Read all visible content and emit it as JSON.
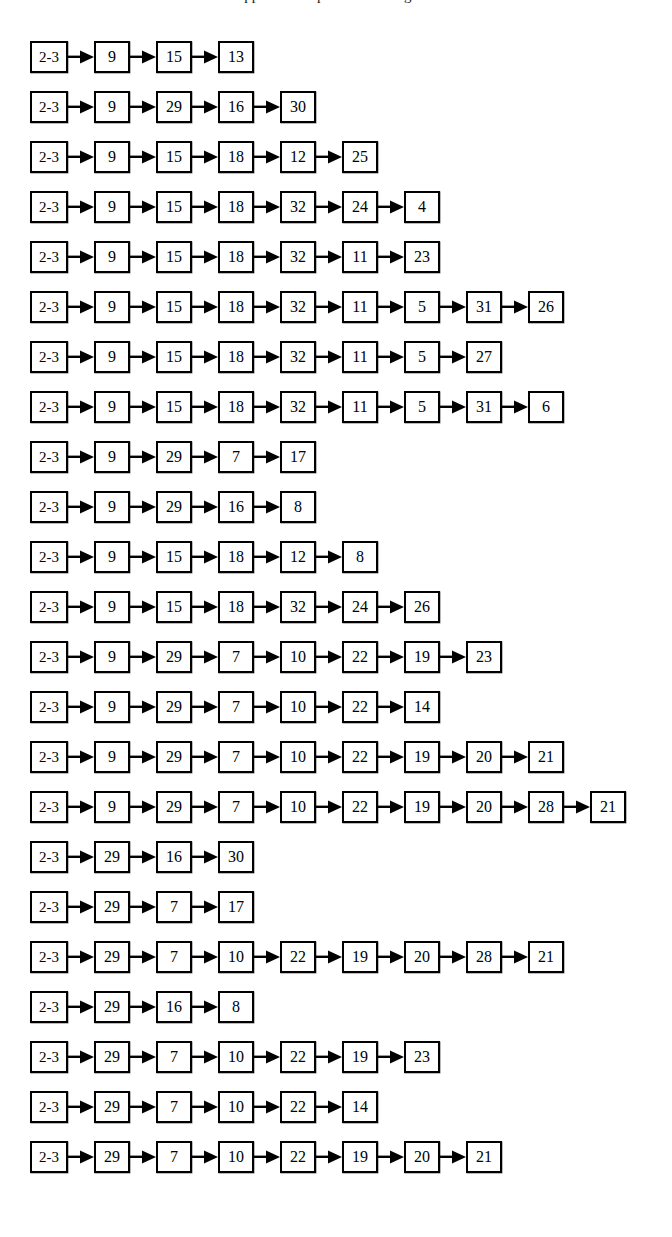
{
  "document": {
    "type": "flow-chain-diagram",
    "caption_partial": "appear to be produced using the",
    "background_color": "#ffffff",
    "line_color": "#000000",
    "text_color": "#000000",
    "root_label": "2-3",
    "arrow_glyph": "right-arrow",
    "row_count": 23
  },
  "chains": [
    {
      "nodes": [
        "2-3",
        "9",
        "15",
        "13"
      ]
    },
    {
      "nodes": [
        "2-3",
        "9",
        "29",
        "16",
        "30"
      ]
    },
    {
      "nodes": [
        "2-3",
        "9",
        "15",
        "18",
        "12",
        "25"
      ]
    },
    {
      "nodes": [
        "2-3",
        "9",
        "15",
        "18",
        "32",
        "24",
        "4"
      ]
    },
    {
      "nodes": [
        "2-3",
        "9",
        "15",
        "18",
        "32",
        "11",
        "23"
      ]
    },
    {
      "nodes": [
        "2-3",
        "9",
        "15",
        "18",
        "32",
        "11",
        "5",
        "31",
        "26"
      ]
    },
    {
      "nodes": [
        "2-3",
        "9",
        "15",
        "18",
        "32",
        "11",
        "5",
        "27"
      ]
    },
    {
      "nodes": [
        "2-3",
        "9",
        "15",
        "18",
        "32",
        "11",
        "5",
        "31",
        "6"
      ]
    },
    {
      "nodes": [
        "2-3",
        "9",
        "29",
        "7",
        "17"
      ]
    },
    {
      "nodes": [
        "2-3",
        "9",
        "29",
        "16",
        "8"
      ]
    },
    {
      "nodes": [
        "2-3",
        "9",
        "15",
        "18",
        "12",
        "8"
      ]
    },
    {
      "nodes": [
        "2-3",
        "9",
        "15",
        "18",
        "32",
        "24",
        "26"
      ]
    },
    {
      "nodes": [
        "2-3",
        "9",
        "29",
        "7",
        "10",
        "22",
        "19",
        "23"
      ]
    },
    {
      "nodes": [
        "2-3",
        "9",
        "29",
        "7",
        "10",
        "22",
        "14"
      ]
    },
    {
      "nodes": [
        "2-3",
        "9",
        "29",
        "7",
        "10",
        "22",
        "19",
        "20",
        "21"
      ]
    },
    {
      "nodes": [
        "2-3",
        "9",
        "29",
        "7",
        "10",
        "22",
        "19",
        "20",
        "28",
        "21"
      ]
    },
    {
      "nodes": [
        "2-3",
        "29",
        "16",
        "30"
      ]
    },
    {
      "nodes": [
        "2-3",
        "29",
        "7",
        "17"
      ]
    },
    {
      "nodes": [
        "2-3",
        "29",
        "7",
        "10",
        "22",
        "19",
        "20",
        "28",
        "21"
      ]
    },
    {
      "nodes": [
        "2-3",
        "29",
        "16",
        "8"
      ]
    },
    {
      "nodes": [
        "2-3",
        "29",
        "7",
        "10",
        "22",
        "19",
        "23"
      ]
    },
    {
      "nodes": [
        "2-3",
        "29",
        "7",
        "10",
        "22",
        "14"
      ]
    },
    {
      "nodes": [
        "2-3",
        "29",
        "7",
        "10",
        "22",
        "19",
        "20",
        "21"
      ]
    }
  ]
}
